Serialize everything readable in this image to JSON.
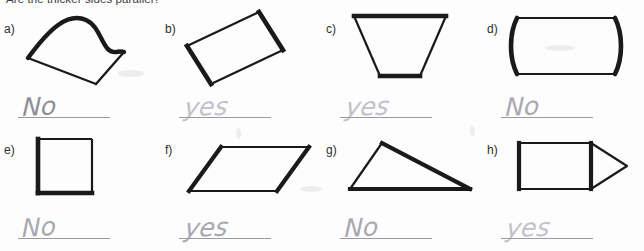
{
  "worksheet": {
    "prompt": "Are the thicker sides parallel?"
  },
  "problems": [
    {
      "label": "a)",
      "shape_name": "closed-curve-blob",
      "answer": "No",
      "ink": "ink-dark",
      "tilt": "tilt-a"
    },
    {
      "label": "b)",
      "shape_name": "tilted-rectangle",
      "answer": "yes",
      "ink": "ink-light",
      "tilt": "tilt-b"
    },
    {
      "label": "c)",
      "shape_name": "trapezoid",
      "answer": "yes",
      "ink": "ink-light",
      "tilt": "tilt-c"
    },
    {
      "label": "d)",
      "shape_name": "curved-barrel",
      "answer": "No",
      "ink": "ink-mid",
      "tilt": "tilt-a"
    },
    {
      "label": "e)",
      "shape_name": "square",
      "answer": "No",
      "ink": "ink-mid",
      "tilt": "tilt-d"
    },
    {
      "label": "f)",
      "shape_name": "parallelogram",
      "answer": "yes",
      "ink": "ink-mid",
      "tilt": "tilt-c"
    },
    {
      "label": "g)",
      "shape_name": "right-triangle",
      "answer": "No",
      "ink": "ink-mid",
      "tilt": "tilt-a"
    },
    {
      "label": "h)",
      "shape_name": "arrow-pentagon",
      "answer": "yes",
      "ink": "ink-light",
      "tilt": "tilt-b"
    }
  ],
  "colors": {
    "shape_stroke": "#1a1a1a",
    "pencil": "#b6b6bd",
    "rule_line": "#9a9aa2",
    "label_text": "#2e2e2e",
    "prompt_text": "#3b3b3b"
  }
}
